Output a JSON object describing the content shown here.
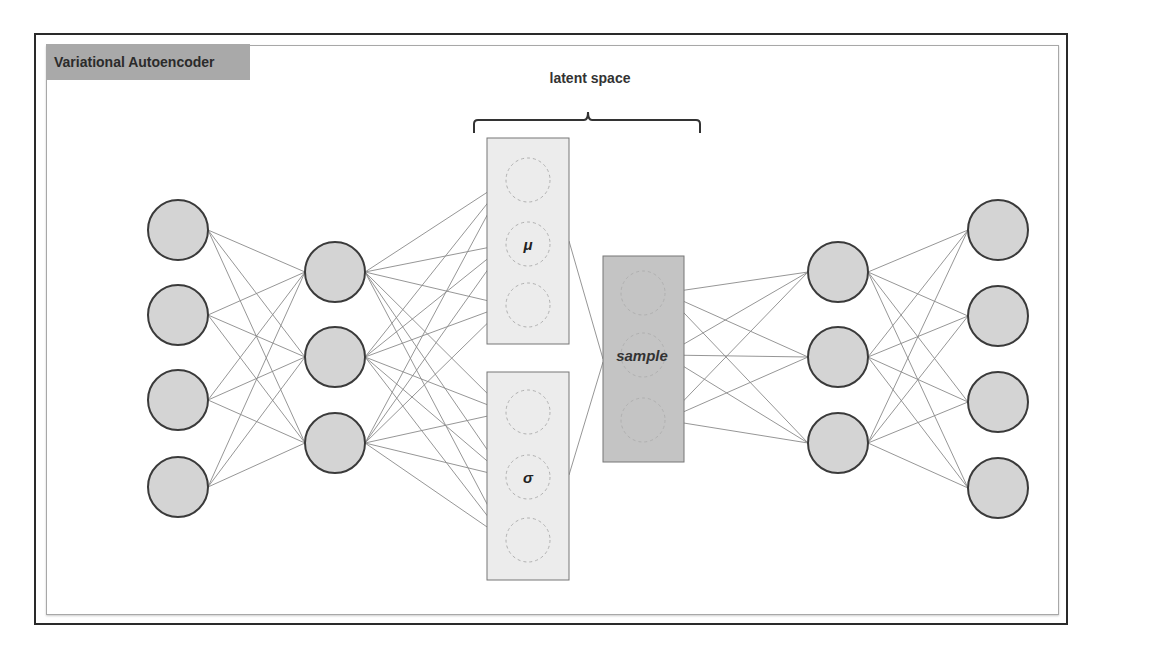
{
  "title": "Variational Autoencoder",
  "latent_label": "latent space",
  "mu_label": "μ",
  "sigma_label": "σ",
  "sample_label": "sample",
  "colors": {
    "frame": "#2a2a2a",
    "inner_frame": "#a8a8a8",
    "title_bg": "#a9a9a9",
    "node_fill": "#d4d4d4",
    "node_stroke": "#3a3a3a",
    "edge": "#8a8a8a",
    "latent_box_fill": "#ececec",
    "sample_box_fill": "#c4c4c4"
  },
  "layers": {
    "input": {
      "x": 178,
      "ys": [
        230,
        315,
        400,
        487
      ],
      "r": 30
    },
    "encoder_hidden": {
      "x": 335,
      "ys": [
        272,
        357,
        443
      ],
      "r": 30
    },
    "mu": {
      "x": 528,
      "ys": [
        180,
        244,
        305
      ],
      "r": 22
    },
    "sigma": {
      "x": 528,
      "ys": [
        412,
        477,
        540
      ],
      "r": 22
    },
    "sample": {
      "x": 643,
      "ys": [
        293,
        355,
        420
      ],
      "r": 22
    },
    "decoder_hidden": {
      "x": 838,
      "ys": [
        272,
        357,
        443
      ],
      "r": 30
    },
    "output": {
      "x": 998,
      "ys": [
        230,
        316,
        402,
        488
      ],
      "r": 30
    }
  }
}
